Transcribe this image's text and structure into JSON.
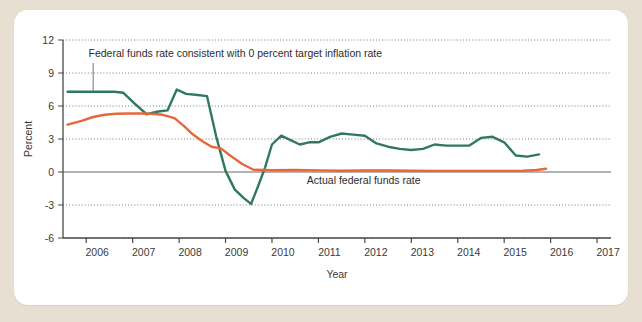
{
  "figure": {
    "background_color": "#e7dfd1",
    "card_color": "#ffffff"
  },
  "chart_data": {
    "type": "line",
    "title": "",
    "xlabel": "Year",
    "ylabel": "Percent",
    "xlim": [
      2005.5,
      2017.3
    ],
    "ylim": [
      -6,
      12
    ],
    "yticks": [
      -6,
      -3,
      0,
      3,
      6,
      9,
      12
    ],
    "ytick_labels": [
      "-6",
      "-3",
      "0",
      "3",
      "6",
      "9",
      "12"
    ],
    "xticks": [
      2006,
      2007,
      2008,
      2009,
      2010,
      2011,
      2012,
      2013,
      2014,
      2015,
      2016,
      2017
    ],
    "xtick_labels": [
      "2006",
      "2007",
      "2008",
      "2009",
      "2010",
      "2011",
      "2012",
      "2013",
      "2014",
      "2015",
      "2016",
      "2017"
    ],
    "grid": "horizontal-dotted",
    "legend": "annotated-inline",
    "annotations": [
      {
        "name": "taylor-rule-label",
        "text": "Federal funds rate consistent with 0 percent target inflation rate",
        "x": 2006.05,
        "y": 10.45,
        "leader_from": [
          2006.15,
          9.9
        ],
        "leader_to": [
          2006.15,
          7.35
        ]
      },
      {
        "name": "actual-rate-label",
        "text": "Actual federal funds rate",
        "x": 2010.75,
        "y": -1.1
      }
    ],
    "series": [
      {
        "name": "Federal funds rate consistent with 0 percent target inflation rate",
        "color": "#2f7a5f",
        "x": [
          2005.6,
          2006.0,
          2006.3,
          2006.6,
          2006.8,
          2007.05,
          2007.3,
          2007.55,
          2007.75,
          2007.95,
          2008.15,
          2008.4,
          2008.6,
          2008.8,
          2009.0,
          2009.2,
          2009.4,
          2009.55,
          2009.7,
          2009.85,
          2010.0,
          2010.2,
          2010.4,
          2010.6,
          2010.8,
          2011.0,
          2011.25,
          2011.5,
          2011.75,
          2012.0,
          2012.25,
          2012.5,
          2012.75,
          2013.0,
          2013.25,
          2013.5,
          2013.75,
          2014.0,
          2014.25,
          2014.5,
          2014.75,
          2015.0,
          2015.25,
          2015.5,
          2015.75
        ],
        "y": [
          7.3,
          7.3,
          7.3,
          7.3,
          7.2,
          6.2,
          5.25,
          5.5,
          5.6,
          7.5,
          7.1,
          7.0,
          6.9,
          3.2,
          0.1,
          -1.6,
          -2.4,
          -2.9,
          -1.3,
          0.4,
          2.5,
          3.3,
          2.9,
          2.5,
          2.7,
          2.7,
          3.2,
          3.5,
          3.4,
          3.3,
          2.6,
          2.3,
          2.1,
          2.0,
          2.1,
          2.5,
          2.4,
          2.4,
          2.4,
          3.1,
          3.2,
          2.7,
          1.5,
          1.4,
          1.6
        ]
      },
      {
        "name": "Actual federal funds rate",
        "color": "#e6673b",
        "x": [
          2005.6,
          2005.9,
          2006.15,
          2006.4,
          2006.65,
          2006.9,
          2007.15,
          2007.4,
          2007.65,
          2007.9,
          2008.1,
          2008.3,
          2008.5,
          2008.7,
          2008.9,
          2009.1,
          2009.35,
          2009.6,
          2010.0,
          2010.5,
          2011.0,
          2011.5,
          2012.0,
          2012.5,
          2013.0,
          2013.5,
          2014.0,
          2014.5,
          2015.0,
          2015.4,
          2015.7,
          2015.9
        ],
        "y": [
          4.3,
          4.65,
          5.0,
          5.2,
          5.3,
          5.32,
          5.32,
          5.3,
          5.2,
          4.9,
          4.2,
          3.4,
          2.8,
          2.3,
          2.15,
          1.5,
          0.75,
          0.2,
          0.16,
          0.18,
          0.15,
          0.12,
          0.14,
          0.14,
          0.12,
          0.1,
          0.1,
          0.1,
          0.1,
          0.12,
          0.18,
          0.3
        ]
      }
    ]
  }
}
